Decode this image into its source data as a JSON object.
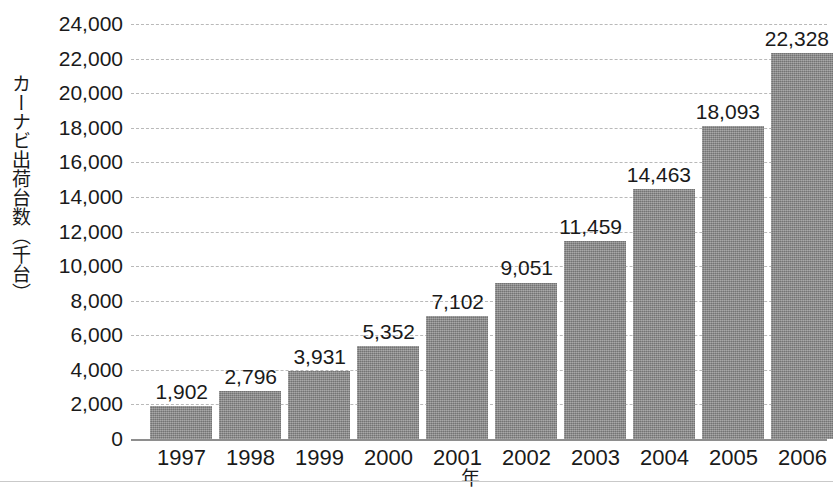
{
  "chart_data": {
    "type": "bar",
    "title": "",
    "xlabel": "年",
    "ylabel": "カーナビ出荷台数（千台）",
    "categories": [
      "1997",
      "1998",
      "1999",
      "2000",
      "2001",
      "2002",
      "2003",
      "2004",
      "2005",
      "2006"
    ],
    "values": [
      1902,
      2796,
      3931,
      5352,
      7102,
      9051,
      11459,
      14463,
      18093,
      22328
    ],
    "value_labels": [
      "1,902",
      "2,796",
      "3,931",
      "5,352",
      "7,102",
      "9,051",
      "11,459",
      "14,463",
      "18,093",
      "22,328"
    ],
    "ylim": [
      0,
      24000
    ],
    "ytick_values": [
      0,
      2000,
      4000,
      6000,
      8000,
      10000,
      12000,
      14000,
      16000,
      18000,
      20000,
      22000,
      24000
    ],
    "ytick_labels": [
      "0",
      "2,000",
      "4,000",
      "6,000",
      "8,000",
      "10,000",
      "12,000",
      "14,000",
      "16,000",
      "18,000",
      "20,000",
      "22,000",
      "24,000"
    ],
    "grid": true,
    "grid_style": "dashed",
    "legend": false,
    "bar_color": "#8c8c8c",
    "gridline_color": "#b9b9b9",
    "axis_color": "#8e8e8e",
    "text_color": "#1a1a1a",
    "background_color": "#ffffff"
  }
}
